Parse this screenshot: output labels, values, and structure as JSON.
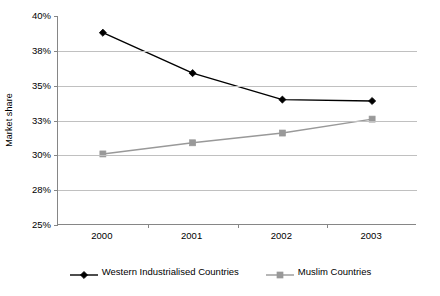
{
  "chart_data": {
    "type": "line",
    "title": "",
    "xlabel": "",
    "ylabel": "Market share",
    "categories": [
      "2000",
      "2001",
      "2002",
      "2003"
    ],
    "ylim": [
      25,
      40
    ],
    "ytick_values": [
      40,
      37.5,
      35,
      32.5,
      30,
      27.5,
      25
    ],
    "ytick_labels": [
      "40%",
      "38%",
      "35%",
      "33%",
      "30%",
      "28%",
      "25%"
    ],
    "grid": "horizontal",
    "legend_position": "bottom",
    "series": [
      {
        "name": "Western Industrialised Countries",
        "color": "#000000",
        "marker": "diamond",
        "values": [
          38.8,
          35.9,
          34.0,
          33.9
        ]
      },
      {
        "name": "Muslim Countries",
        "color": "#999999",
        "marker": "square",
        "values": [
          30.1,
          30.9,
          31.6,
          32.6
        ]
      }
    ]
  },
  "axes": {
    "y_title": "Market share"
  },
  "legend": {
    "entries": [
      {
        "label": "Western Industrialised Countries"
      },
      {
        "label": "Muslim Countries"
      }
    ]
  }
}
